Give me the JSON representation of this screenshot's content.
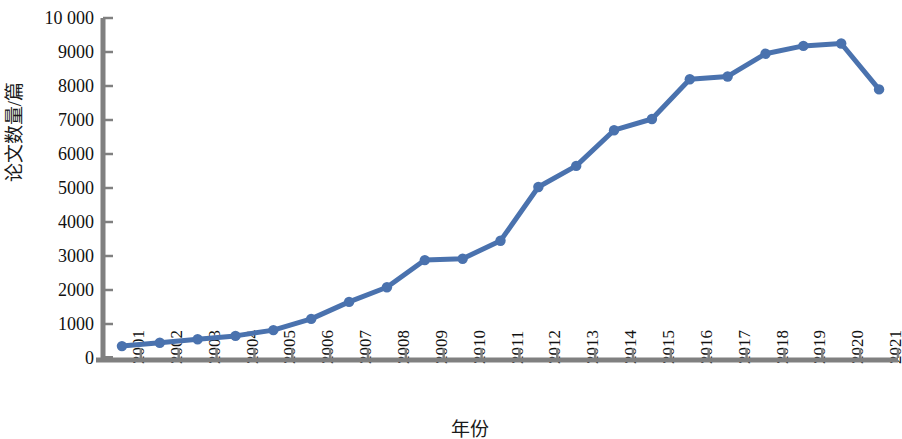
{
  "chart_data": {
    "type": "line",
    "title": "",
    "xlabel": "年份",
    "ylabel": "论文数量/篇",
    "categories": [
      "2001",
      "2002",
      "2003",
      "2004",
      "2005",
      "2006",
      "2007",
      "2008",
      "2009",
      "2010",
      "2011",
      "2012",
      "2013",
      "2014",
      "2015",
      "2016",
      "2017",
      "2018",
      "2019",
      "2020",
      "2021"
    ],
    "values": [
      350,
      450,
      550,
      650,
      820,
      1150,
      1650,
      2080,
      2880,
      2920,
      3450,
      5030,
      5650,
      6700,
      7030,
      8200,
      8280,
      8950,
      9180,
      9250,
      7900
    ],
    "series": [
      {
        "name": "论文数量",
        "values": [
          350,
          450,
          550,
          650,
          820,
          1150,
          1650,
          2080,
          2880,
          2920,
          3450,
          5030,
          5650,
          6700,
          7030,
          8200,
          8280,
          8950,
          9180,
          9250,
          7900
        ]
      }
    ],
    "ylim": [
      0,
      10000
    ],
    "ytick_values": [
      0,
      1000,
      2000,
      3000,
      4000,
      5000,
      6000,
      7000,
      8000,
      9000,
      10000
    ],
    "ytick_labels": [
      "0",
      "1000",
      "2000",
      "3000",
      "4000",
      "5000",
      "6000",
      "7000",
      "8000",
      "9000",
      "10 000"
    ],
    "grid": false,
    "legend": "none",
    "markers": true,
    "marker_shape": "circle",
    "line_color": "#4A72AE",
    "marker_color": "#4A72AE",
    "axis_color": "#808080",
    "text_color": "#111111",
    "background_color": "#ffffff",
    "xtick_label_rotation": "90"
  }
}
